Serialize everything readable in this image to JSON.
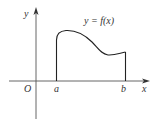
{
  "diagram": {
    "type": "function-graph",
    "curve_label": "y = f(x)",
    "axes": {
      "x_label": "x",
      "y_label": "y",
      "origin_label": "O"
    },
    "interval": {
      "left_label": "a",
      "right_label": "b"
    },
    "colors": {
      "stroke": "#333333",
      "background": "#ffffff"
    }
  }
}
